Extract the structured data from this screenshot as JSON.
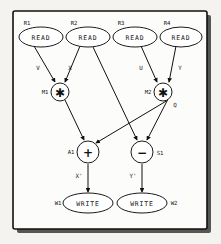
{
  "figure": {
    "kind": "dataflow-graph",
    "background_color": "#f4f3f0",
    "frame_color": "#111111",
    "node_fill": "#ffffff"
  },
  "nodes": {
    "read_nodes": [
      {
        "id": "R1",
        "label": "READ",
        "cx": 41,
        "cy": 37,
        "rx": 22,
        "ry": 10,
        "id_x": 27,
        "id_y": 23
      },
      {
        "id": "R2",
        "label": "READ",
        "cx": 88,
        "cy": 37,
        "rx": 22,
        "ry": 10,
        "id_x": 74,
        "id_y": 23
      },
      {
        "id": "R3",
        "label": "READ",
        "cx": 135,
        "cy": 37,
        "rx": 22,
        "ry": 10,
        "id_x": 121,
        "id_y": 23
      },
      {
        "id": "R4",
        "label": "READ",
        "cx": 181,
        "cy": 37,
        "rx": 21,
        "ry": 10,
        "id_x": 167,
        "id_y": 23
      }
    ],
    "mul_nodes": [
      {
        "id": "M1",
        "op": "✱",
        "cx": 60,
        "cy": 92,
        "r": 9,
        "id_x": 45,
        "id_y": 92
      },
      {
        "id": "M2",
        "op": "✱",
        "cx": 163,
        "cy": 92,
        "r": 9,
        "id_x": 148,
        "id_y": 92
      }
    ],
    "alu_nodes": [
      {
        "id": "A1",
        "op": "+",
        "cx": 88,
        "cy": 152,
        "r": 11,
        "id_x": 71,
        "id_y": 152
      },
      {
        "id": "S1",
        "op": "−",
        "cx": 142,
        "cy": 152,
        "r": 11,
        "id_x": 160,
        "id_y": 153
      }
    ],
    "write_nodes": [
      {
        "id": "W1",
        "label": "WRITE",
        "cx": 88,
        "cy": 203,
        "rx": 25,
        "ry": 10,
        "id_x": 58,
        "id_y": 203
      },
      {
        "id": "W2",
        "label": "WRITE",
        "cx": 142,
        "cy": 203,
        "rx": 25,
        "ry": 10,
        "id_x": 174,
        "id_y": 203
      }
    ]
  },
  "edge_labels": [
    {
      "name": "V",
      "text": "V",
      "x": 38,
      "y": 68
    },
    {
      "name": "X",
      "text": "X",
      "x": 70,
      "y": 68
    },
    {
      "name": "U",
      "text": "U",
      "x": 141,
      "y": 68
    },
    {
      "name": "Y",
      "text": "Y",
      "x": 180,
      "y": 68
    },
    {
      "name": "Q",
      "text": "Q",
      "x": 175,
      "y": 105
    },
    {
      "name": "Xprime",
      "text": "X'",
      "x": 79,
      "y": 176
    },
    {
      "name": "Yprime",
      "text": "Y'",
      "x": 133,
      "y": 176
    }
  ],
  "edges": [
    {
      "from": "R1",
      "to": "M1",
      "label": "V"
    },
    {
      "from": "R2",
      "to": "M1",
      "label": "X"
    },
    {
      "from": "R2",
      "to": "S1",
      "label": ""
    },
    {
      "from": "R3",
      "to": "M2",
      "label": "U"
    },
    {
      "from": "R4",
      "to": "M2",
      "label": "Y"
    },
    {
      "from": "M1",
      "to": "A1",
      "label": ""
    },
    {
      "from": "M2",
      "to": "A1",
      "label": "Q"
    },
    {
      "from": "M2",
      "to": "S1",
      "label": "Q"
    },
    {
      "from": "A1",
      "to": "W1",
      "label": "X'"
    },
    {
      "from": "S1",
      "to": "W2",
      "label": "Y'"
    }
  ]
}
